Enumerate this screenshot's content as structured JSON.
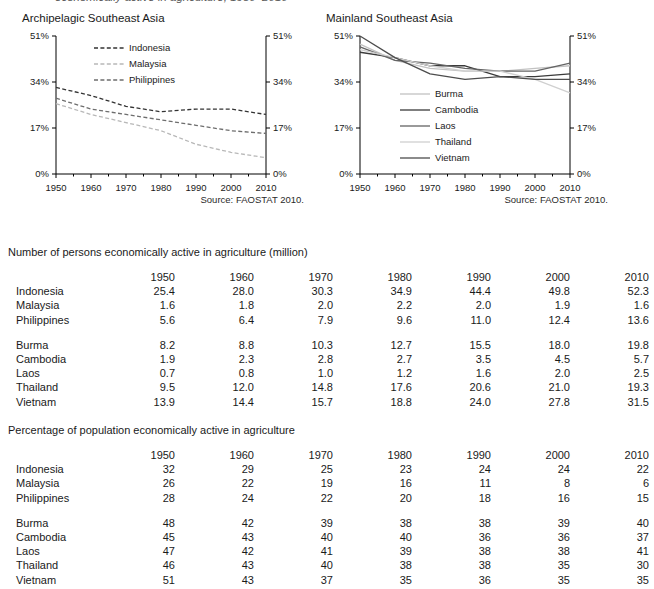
{
  "page": {
    "cut_off_header": "economically active in agriculture, 1950–2010"
  },
  "charts": [
    {
      "id": "archipelagic",
      "title": "Archipelagic Southeast Asia",
      "source": "Source: FAOSTAT 2010.",
      "y_ticks": [
        "0%",
        "17%",
        "34%",
        "51%"
      ],
      "x_ticks": [
        "1950",
        "1960",
        "1970",
        "1980",
        "1990",
        "2000",
        "2010"
      ],
      "legend": [
        "Indonesia",
        "Malaysia",
        "Philippines"
      ]
    },
    {
      "id": "mainland",
      "title": "Mainland Southeast Asia",
      "source": "Source: FAOSTAT 2010.",
      "y_ticks": [
        "0%",
        "17%",
        "34%",
        "51%"
      ],
      "x_ticks": [
        "1950",
        "1960",
        "1970",
        "1980",
        "1990",
        "2000",
        "2010"
      ],
      "legend": [
        "Burma",
        "Cambodia",
        "Laos",
        "Thailand",
        "Vietnam"
      ]
    }
  ],
  "chart_data": [
    {
      "type": "line",
      "title": "Archipelagic Southeast Asia",
      "subtitle": "",
      "xlabel": "",
      "ylabel": "",
      "x": [
        1950,
        1960,
        1970,
        1980,
        1990,
        2000,
        2010
      ],
      "xlim": [
        1950,
        2010
      ],
      "ylim": [
        0,
        51
      ],
      "yticks": [
        0,
        17,
        34,
        51
      ],
      "ytick_labels": [
        "0%",
        "17%",
        "34%",
        "51%"
      ],
      "xtick_labels": [
        "1950",
        "1960",
        "1970",
        "1980",
        "1990",
        "2000",
        "2010"
      ],
      "grid": false,
      "legend_position": "inside-top-center",
      "annotations": [
        "Source: FAOSTAT 2010."
      ],
      "series": [
        {
          "name": "Indonesia",
          "values": [
            32,
            29,
            25,
            23,
            24,
            24,
            22
          ],
          "style": "dashed",
          "color": "#333333"
        },
        {
          "name": "Malaysia",
          "values": [
            26,
            22,
            19,
            16,
            11,
            8,
            6
          ],
          "style": "dashed",
          "color": "#b8b8b8"
        },
        {
          "name": "Philippines",
          "values": [
            28,
            24,
            22,
            20,
            18,
            16,
            15
          ],
          "style": "dashed",
          "color": "#6e6e6e"
        }
      ]
    },
    {
      "type": "line",
      "title": "Mainland Southeast Asia",
      "subtitle": "",
      "xlabel": "",
      "ylabel": "",
      "x": [
        1950,
        1960,
        1970,
        1980,
        1990,
        2000,
        2010
      ],
      "xlim": [
        1950,
        2010
      ],
      "ylim": [
        0,
        51
      ],
      "yticks": [
        0,
        17,
        34,
        51
      ],
      "ytick_labels": [
        "0%",
        "17%",
        "34%",
        "51%"
      ],
      "xtick_labels": [
        "1950",
        "1960",
        "1970",
        "1980",
        "1990",
        "2000",
        "2010"
      ],
      "grid": false,
      "legend_position": "inside-center",
      "annotations": [
        "Source: FAOSTAT 2010."
      ],
      "series": [
        {
          "name": "Burma",
          "values": [
            48,
            42,
            39,
            38,
            38,
            39,
            40
          ],
          "style": "solid",
          "color": "#c2c2c2"
        },
        {
          "name": "Cambodia",
          "values": [
            45,
            43,
            40,
            40,
            36,
            36,
            37
          ],
          "style": "solid",
          "color": "#3a3a3a"
        },
        {
          "name": "Laos",
          "values": [
            47,
            42,
            41,
            39,
            38,
            38,
            41
          ],
          "style": "solid",
          "color": "#646464"
        },
        {
          "name": "Thailand",
          "values": [
            46,
            43,
            40,
            38,
            38,
            35,
            30
          ],
          "style": "solid",
          "color": "#d0d0d0"
        },
        {
          "name": "Vietnam",
          "values": [
            51,
            43,
            37,
            35,
            36,
            35,
            35
          ],
          "style": "solid",
          "color": "#4d4d4d"
        }
      ]
    }
  ],
  "table_persons": {
    "caption": "Number of persons economically active in agriculture (million)",
    "columns": [
      "",
      "1950",
      "1960",
      "1970",
      "1980",
      "1990",
      "2000",
      "2010"
    ],
    "group_a": [
      {
        "name": "Indonesia",
        "values": [
          "25.4",
          "28.0",
          "30.3",
          "34.9",
          "44.4",
          "49.8",
          "52.3"
        ]
      },
      {
        "name": "Malaysia",
        "values": [
          "1.6",
          "1.8",
          "2.0",
          "2.2",
          "2.0",
          "1.9",
          "1.6"
        ]
      },
      {
        "name": "Philippines",
        "values": [
          "5.6",
          "6.4",
          "7.9",
          "9.6",
          "11.0",
          "12.4",
          "13.6"
        ]
      }
    ],
    "group_b": [
      {
        "name": "Burma",
        "values": [
          "8.2",
          "8.8",
          "10.3",
          "12.7",
          "15.5",
          "18.0",
          "19.8"
        ]
      },
      {
        "name": "Cambodia",
        "values": [
          "1.9",
          "2.3",
          "2.8",
          "2.7",
          "3.5",
          "4.5",
          "5.7"
        ]
      },
      {
        "name": "Laos",
        "values": [
          "0.7",
          "0.8",
          "1.0",
          "1.2",
          "1.6",
          "2.0",
          "2.5"
        ]
      },
      {
        "name": "Thailand",
        "values": [
          "9.5",
          "12.0",
          "14.8",
          "17.6",
          "20.6",
          "21.0",
          "19.3"
        ]
      },
      {
        "name": "Vietnam",
        "values": [
          "13.9",
          "14.4",
          "15.7",
          "18.8",
          "24.0",
          "27.8",
          "31.5"
        ]
      }
    ]
  },
  "table_percentage": {
    "caption": "Percentage of population economically active in agriculture",
    "columns": [
      "",
      "1950",
      "1960",
      "1970",
      "1980",
      "1990",
      "2000",
      "2010"
    ],
    "group_a": [
      {
        "name": "Indonesia",
        "values": [
          "32",
          "29",
          "25",
          "23",
          "24",
          "24",
          "22"
        ]
      },
      {
        "name": "Malaysia",
        "values": [
          "26",
          "22",
          "19",
          "16",
          "11",
          "8",
          "6"
        ]
      },
      {
        "name": "Philippines",
        "values": [
          "28",
          "24",
          "22",
          "20",
          "18",
          "16",
          "15"
        ]
      }
    ],
    "group_b": [
      {
        "name": "Burma",
        "values": [
          "48",
          "42",
          "39",
          "38",
          "38",
          "39",
          "40"
        ]
      },
      {
        "name": "Cambodia",
        "values": [
          "45",
          "43",
          "40",
          "40",
          "36",
          "36",
          "37"
        ]
      },
      {
        "name": "Laos",
        "values": [
          "47",
          "42",
          "41",
          "39",
          "38",
          "38",
          "41"
        ]
      },
      {
        "name": "Thailand",
        "values": [
          "46",
          "43",
          "40",
          "38",
          "38",
          "35",
          "30"
        ]
      },
      {
        "name": "Vietnam",
        "values": [
          "51",
          "43",
          "37",
          "35",
          "36",
          "35",
          "35"
        ]
      }
    ]
  }
}
